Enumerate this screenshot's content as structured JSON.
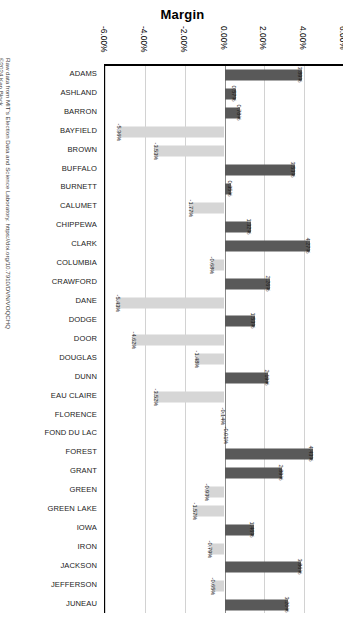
{
  "attribution": {
    "line1": "Raw data from MIT's Election Data and Science Laboratory. https://doi.org/10.7910/DVN/VOQCHQ",
    "line2": "©2024 Ken Block"
  },
  "chart_data": {
    "type": "bar",
    "orientation": "horizontal",
    "title": "Margin",
    "xlabel": "",
    "ylabel": "",
    "xlim": [
      -6,
      6
    ],
    "grid": true,
    "legend": "none",
    "tick_labels": [
      "-6.00%",
      "-4.00%",
      "-2.00%",
      "0.00%",
      "2.00%",
      "4.00%",
      "6.00%"
    ],
    "ticks": [
      -6,
      -4,
      -2,
      0,
      2,
      4,
      6
    ],
    "colors": {
      "positive": "#595959",
      "negative": "#d6d6d6"
    },
    "categories": [
      "ADAMS",
      "ASHLAND",
      "BARRON",
      "BAYFIELD",
      "BROWN",
      "BUFFALO",
      "BURNETT",
      "CALUMET",
      "CHIPPEWA",
      "CLARK",
      "COLUMBIA",
      "CRAWFORD",
      "DANE",
      "DODGE",
      "DOOR",
      "DOUGLAS",
      "DUNN",
      "EAU CLAIRE",
      "FLORENCE",
      "FOND DU LAC",
      "FOREST",
      "GRANT",
      "GREEN",
      "GREEN LAKE",
      "IOWA",
      "IRON",
      "JACKSON",
      "JEFFERSON",
      "JUNEAU"
    ],
    "values": [
      3.89,
      0.57,
      0.78,
      -5.36,
      -3.53,
      3.53,
      0.35,
      -1.77,
      1.32,
      4.27,
      -0.68,
      2.26,
      -5.43,
      1.53,
      -4.62,
      -1.48,
      2.19,
      -3.52,
      -0.14,
      -0.01,
      4.43,
      2.89,
      -0.93,
      -1.57,
      1.46,
      -0.79,
      3.86,
      -0.65,
      3.2
    ],
    "value_labels": [
      "3.89%",
      "0.57%",
      "0.78%",
      "-5.36%",
      "-3.53%",
      "3.53%",
      "0.35%",
      "-1.77%",
      "1.32%",
      "4.27%",
      "-0.68%",
      "2.26%",
      "-5.43%",
      "1.53%",
      "-4.62%",
      "-1.48%",
      "2.19%",
      "-3.52%",
      "-0.14%",
      "-0.01%",
      "4.43%",
      "2.89%",
      "-0.93%",
      "-1.57%",
      "1.46%",
      "-0.79%",
      "3.86%",
      "-0.65%",
      "3.20%"
    ]
  }
}
